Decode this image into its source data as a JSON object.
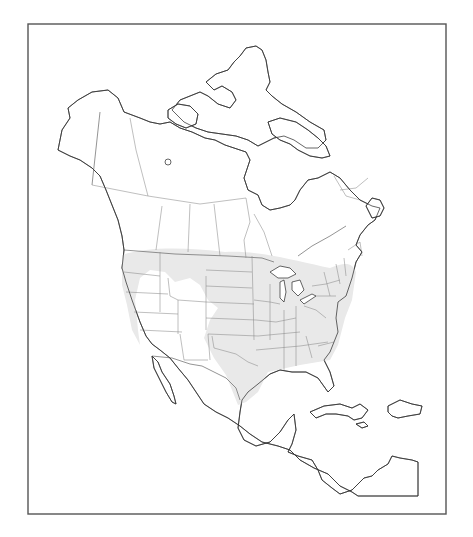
{
  "map": {
    "title": "",
    "region": "North America",
    "style": "outline map with shaded range",
    "colors": {
      "background": "#ffffff",
      "frame": "#555555",
      "coastline": "#333333",
      "borders": "#8a8a8a",
      "range_fill": "#e9e9e9"
    },
    "frame": {
      "x": 28,
      "y": 24,
      "width": 418,
      "height": 490
    },
    "range": {
      "description": "shaded distribution area covering central and eastern United States and southern Canada border zone",
      "path": "M122 255 C150 246 190 248 225 252 C260 250 300 262 330 268 C345 262 352 262 356 272 L352 300 L345 318 L338 345 L330 360 L300 365 L268 372 L258 392 L246 402 L238 405 L232 390 L226 375 L214 358 L204 338 L210 320 L218 308 L208 300 L200 285 L190 278 L175 282 L165 272 L150 270 L140 278 L135 300 L138 330 L140 345 L132 330 L127 305 L122 285 Z"
    },
    "land": [
      {
        "name": "north-america-mainland",
        "path": "M58 150 L62 130 L70 118 L68 108 L78 100 L92 92 L108 90 L118 98 L124 112 L140 118 L150 122 L160 124 L170 122 L180 128 L192 132 L205 138 L215 140 L225 145 L240 150 L246 152 L250 160 L244 178 L248 190 L258 195 L262 205 L270 210 L280 208 L290 205 L295 200 L300 190 L308 180 L318 178 L330 172 L340 178 L350 190 L360 200 L372 206 L380 208 L375 220 L368 225 L360 235 L356 245 L362 252 L356 262 L352 278 L346 296 L338 302 L336 318 L338 332 L330 352 L324 360 L330 372 L334 386 L328 392 L318 378 L306 372 L292 372 L280 370 L270 374 L258 384 L248 392 L242 400 L240 412 L238 428 L244 440 L256 446 L270 442 L280 432 L288 420 L294 414 L296 430 L292 444 L288 452 L298 456 L312 460 L318 470 L322 480 L332 488 L340 494 L352 490 L358 484 L364 478 L372 476 L378 470 L388 464 L392 456 L400 458 L412 460 L418 462 L418 496 L380 496 L358 496 L352 492 L340 486 L328 474 L314 468 L300 460 L290 450 L278 446 L262 442 L250 434 L240 426 L228 418 L216 412 L204 404 L196 392 L188 380 L178 368 L170 358 L160 350 L152 344 L146 336 L140 322 L132 300 L126 282 L122 268 L124 250 L122 236 L118 220 L112 205 L106 190 L100 176 L92 168 L80 160 L70 156 Z"
      },
      {
        "name": "baja-california",
        "path": "M152 356 L158 362 L162 372 L170 384 L174 396 L176 404 L172 402 L166 392 L160 380 L154 368 Z"
      },
      {
        "name": "arctic-islands",
        "path": "M172 110 L180 100 L190 96 L200 92 L208 96 L218 104 L230 108 L236 100 L232 92 L222 86 L214 90 L206 82 L216 74 L228 70 L234 62 L240 56 L246 48 L256 46 L262 50 L266 60 L268 72 L270 82 L266 90 L272 96 L282 104 L296 112 L310 122 L324 130 L326 140 L318 148 L306 148 L294 140 L284 136 L274 138 L266 142 L258 146 L248 140 L236 136 L222 134 L208 132 L196 128 L184 122 Z"
      },
      {
        "name": "baffin-island",
        "path": "M268 122 L280 118 L296 122 L308 130 L318 138 L326 146 L330 156 L322 158 L310 156 L298 150 L290 144 L280 140 L272 134 Z"
      },
      {
        "name": "victoria-island",
        "path": "M168 110 L178 104 L190 106 L198 114 L196 124 L186 128 L176 124 L168 118 Z"
      },
      {
        "name": "cuba",
        "path": "M310 412 L324 406 L340 404 L352 408 L360 404 L368 410 L362 418 L354 420 L348 416 L336 414 L326 414 L316 418 Z"
      },
      {
        "name": "hispaniola",
        "path": "M388 406 L400 400 L412 404 L422 406 L420 414 L408 416 L398 418 L392 416 L388 412 Z"
      },
      {
        "name": "jamaica",
        "path": "M356 424 L364 422 L368 426 L362 428 Z"
      },
      {
        "name": "newfoundland",
        "path": "M366 206 L372 198 L380 200 L384 208 L380 216 L372 218 Z"
      }
    ],
    "lakes": [
      {
        "name": "great-bear-lake",
        "cx": 168,
        "cy": 162,
        "r": 3
      },
      {
        "name": "lake-superior",
        "path": "M270 272 L280 266 L290 268 L296 274 L288 278 L278 278 Z"
      },
      {
        "name": "lake-michigan",
        "path": "M280 282 L284 280 L286 292 L284 302 L280 298 Z"
      },
      {
        "name": "lake-huron",
        "path": "M292 282 L300 280 L304 290 L298 296 L292 290 Z"
      },
      {
        "name": "lake-erie",
        "path": "M300 300 L312 294 L316 296 L304 304 Z"
      }
    ],
    "borders": {
      "international": [
        "M100 112 L92 185",
        "M124 250 L175 254 L228 256 L262 258 L274 262",
        "M298 256 L312 246 L330 236 L346 226",
        "M152 356 L172 358 L190 364 L202 366 L214 372 L226 378 L236 388 L240 400"
      ],
      "provincial": [
        "M92 185 L148 196 L200 204 L246 198",
        "M130 118 L136 150 L148 196",
        "M162 206 L156 250",
        "M190 204 L188 252",
        "M214 204 L220 256",
        "M246 198 L250 222 L244 240 L246 258",
        "M254 214 L264 232 L272 256",
        "M334 176 L346 196 L360 200",
        "M340 190 L356 188 L368 178",
        "M348 250 L360 242 L362 256"
      ],
      "states": [
        "M124 272 L160 276",
        "M126 292 L168 294",
        "M134 312 L178 314",
        "M140 330 L182 332",
        "M160 252 L160 312",
        "M168 278 L170 296 L178 300 L178 334",
        "M178 300 L206 302",
        "M206 276 L206 330",
        "M180 334 L184 360",
        "M184 360 L208 360",
        "M208 334 L210 360",
        "M206 270 L252 272",
        "M206 286 L252 288",
        "M206 302 L254 304",
        "M206 318 L256 320",
        "M208 334 L258 336",
        "M212 336 L214 348 L236 354 L248 362 L258 366",
        "M252 256 L254 340",
        "M254 300 L270 302 L280 304",
        "M256 320 L276 322 L296 318",
        "M258 336 L300 332",
        "M256 350 L300 346 L328 342",
        "M270 284 L270 340",
        "M284 310 L284 370",
        "M296 306 L296 366",
        "M304 306 L316 310 L326 318",
        "M306 336 L312 358",
        "M312 286 L326 284 L340 280",
        "M316 296 L336 296",
        "M324 272 L330 296",
        "M336 264 L340 284",
        "M344 258 L346 276",
        "M318 346 L334 342"
      ]
    }
  }
}
